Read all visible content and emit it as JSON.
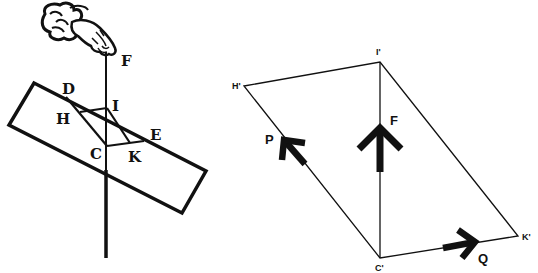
{
  "figure": {
    "colors": {
      "ink": "#111111",
      "background": "#ffffff"
    },
    "left_panel": {
      "description": "Woodcut: hand suspending a block by a plumb line",
      "labels": {
        "F": "F",
        "D": "D",
        "I": "I",
        "H": "H",
        "E": "E",
        "C": "C",
        "K": "K"
      }
    },
    "right_panel": {
      "description": "Parallelogram of forces",
      "vertices": {
        "H": "H'",
        "I": "I'",
        "C": "C'",
        "K": "K'"
      },
      "forces": {
        "F": "F",
        "P": "P",
        "Q": "Q"
      }
    }
  }
}
